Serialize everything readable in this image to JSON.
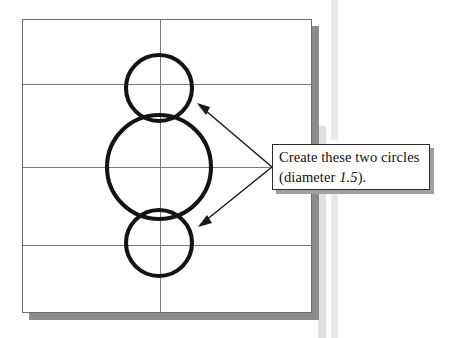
{
  "figure": {
    "paper": {
      "label": "drawing-sheet",
      "background_color": "#ffffff",
      "border_color": "#6d6d6d",
      "shadow_color": "#8c8c8c"
    },
    "grid": {
      "line_color": "#7a7a7a",
      "horizontal_count": 3,
      "vertical_count": 1
    },
    "circles": [
      {
        "name": "top-small-circle",
        "cx": 159,
        "cy": 88,
        "r": 33,
        "diameter_label": "1.5",
        "stroke_color": "#141414"
      },
      {
        "name": "center-large-circle",
        "cx": 159,
        "cy": 167,
        "r": 52,
        "diameter_label": "",
        "stroke_color": "#141414"
      },
      {
        "name": "bottom-small-circle",
        "cx": 159,
        "cy": 243,
        "r": 33,
        "diameter_label": "1.5",
        "stroke_color": "#141414"
      }
    ],
    "callout": {
      "line1": "Create these two circles",
      "line2_prefix": "(diameter ",
      "line2_value": "1.5",
      "line2_suffix": ").",
      "border_color": "#2a2a2a",
      "shadow_color": "#a0a0a0"
    },
    "leaders": [
      {
        "name": "leader-to-top-circle",
        "from_x": 272,
        "from_y": 167,
        "to_x": 197,
        "to_y": 103
      },
      {
        "name": "leader-to-bottom-circle",
        "from_x": 272,
        "from_y": 167,
        "to_x": 198,
        "to_y": 227
      }
    ]
  }
}
